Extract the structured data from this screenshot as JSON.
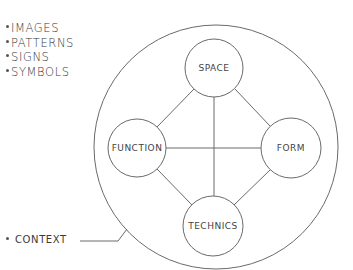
{
  "legend": {
    "items": [
      "IMAGES",
      "PATTERNS",
      "SIGNS",
      "SYMBOLS"
    ]
  },
  "context_label": "CONTEXT",
  "nodes": {
    "top": "SPACE",
    "left": "FUNCTION",
    "right": "FORM",
    "bottom": "TECHNICS"
  },
  "colors": {
    "line": "#6a6a6a",
    "text": "#3a3a3a",
    "background": "#ffffff"
  }
}
